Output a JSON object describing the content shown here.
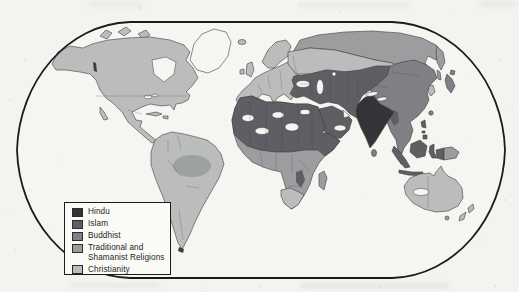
{
  "figure": {
    "kind": "world-religions-thematic-map",
    "paper_color": "#f4f3f0",
    "ocean_color": "#f6f5f2",
    "frame_stroke": "#1b1b1b",
    "coast_stroke": "#3c3e40",
    "border_stroke": "#3f4144"
  },
  "legend": {
    "items": [
      {
        "key": "hindu",
        "label": "Hindu",
        "color": "#323437"
      },
      {
        "key": "islam",
        "label": "Islam",
        "color": "#5d5f63"
      },
      {
        "key": "buddhist",
        "label": "Buddhist",
        "color": "#7e8083"
      },
      {
        "key": "traditional",
        "label": "Traditional and Shamanist Religions",
        "line1": "Traditional and",
        "line2": "Shamanist Religions",
        "color": "#9b9d9e"
      },
      {
        "key": "christianity",
        "label": "Christianity",
        "color": "#bbbdbc"
      }
    ]
  },
  "map": {
    "no_data_color": "#f6f5f2",
    "regions": [
      {
        "name": "North America",
        "religion": "Christianity"
      },
      {
        "name": "Central America and Caribbean",
        "religion": "Christianity"
      },
      {
        "name": "South America",
        "religion": "Christianity"
      },
      {
        "name": "Amazon Basin",
        "religion": "Traditional and Shamanist Religions"
      },
      {
        "name": "Greenland",
        "religion": "unshaded"
      },
      {
        "name": "Europe",
        "religion": "Christianity"
      },
      {
        "name": "European Russia and southern Siberia",
        "religion": "Christianity"
      },
      {
        "name": "Northern Siberia",
        "religion": "Traditional and Shamanist Religions"
      },
      {
        "name": "North Africa and Sahara",
        "religion": "Islam"
      },
      {
        "name": "Arabian Peninsula and Middle East",
        "religion": "Islam"
      },
      {
        "name": "Central Asia",
        "religion": "Islam"
      },
      {
        "name": "Horn of Africa and Swahili coast",
        "religion": "Islam"
      },
      {
        "name": "Sub-Saharan Africa",
        "religion": "Traditional and Shamanist Religions"
      },
      {
        "name": "Southern Africa",
        "religion": "Christianity"
      },
      {
        "name": "Madagascar",
        "religion": "Traditional and Shamanist Religions"
      },
      {
        "name": "India",
        "religion": "Hindu"
      },
      {
        "name": "China, Mongolia, Tibet, mainland Southeast Asia",
        "religion": "Buddhist"
      },
      {
        "name": "Japan",
        "religion": "Buddhist"
      },
      {
        "name": "Indonesia, Malaysia and Philippines",
        "religion": "Islam"
      },
      {
        "name": "New Guinea (east)",
        "religion": "Traditional and Shamanist Religions"
      },
      {
        "name": "Australia and New Zealand",
        "religion": "Christianity"
      }
    ]
  }
}
